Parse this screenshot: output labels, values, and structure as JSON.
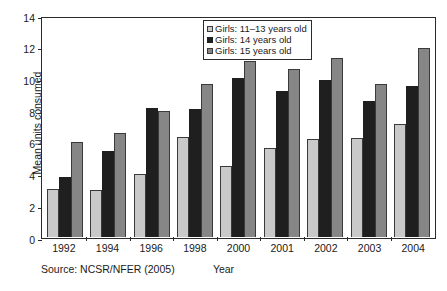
{
  "chart_data": {
    "type": "bar",
    "title": "",
    "xlabel": "Year",
    "ylabel": "Mean units consumed",
    "ylim": [
      0,
      14
    ],
    "yticks": [
      0,
      2,
      4,
      6,
      8,
      10,
      12,
      14
    ],
    "grid": false,
    "legend_position": "top-center",
    "categories": [
      "1992",
      "1994",
      "1996",
      "1998",
      "2000",
      "2001",
      "2002",
      "2003",
      "2004"
    ],
    "series": [
      {
        "name": "Girls: 11–13 years old",
        "color": "#c9c9c9",
        "values": [
          3.05,
          2.95,
          3.95,
          6.3,
          4.5,
          5.6,
          6.2,
          6.25,
          7.15
        ]
      },
      {
        "name": "Girls: 14 years old",
        "color": "#1f1f1f",
        "values": [
          3.8,
          5.45,
          8.15,
          8.05,
          10.0,
          9.2,
          9.9,
          8.55,
          9.55
        ]
      },
      {
        "name": "Girls: 15 years old",
        "color": "#868686",
        "values": [
          6.0,
          6.55,
          7.95,
          9.65,
          11.1,
          10.6,
          11.3,
          9.65,
          11.95
        ]
      }
    ],
    "source": "Source: NCSR/NFER (2005)"
  },
  "axis": {
    "ylabel": "Mean units consumed",
    "xlabel": "Year",
    "ytick_labels": [
      "14",
      "12",
      "10",
      "8",
      "6",
      "4",
      "2",
      "0"
    ]
  },
  "legend": {
    "items": [
      {
        "label": "Girls: 11–13 years old",
        "swatch": "light-gray"
      },
      {
        "label": "Girls: 14 years old",
        "swatch": "black"
      },
      {
        "label": "Girls: 15 years old",
        "swatch": "dark-gray"
      }
    ]
  },
  "footer": {
    "source": "Source: NCSR/NFER (2005)"
  }
}
